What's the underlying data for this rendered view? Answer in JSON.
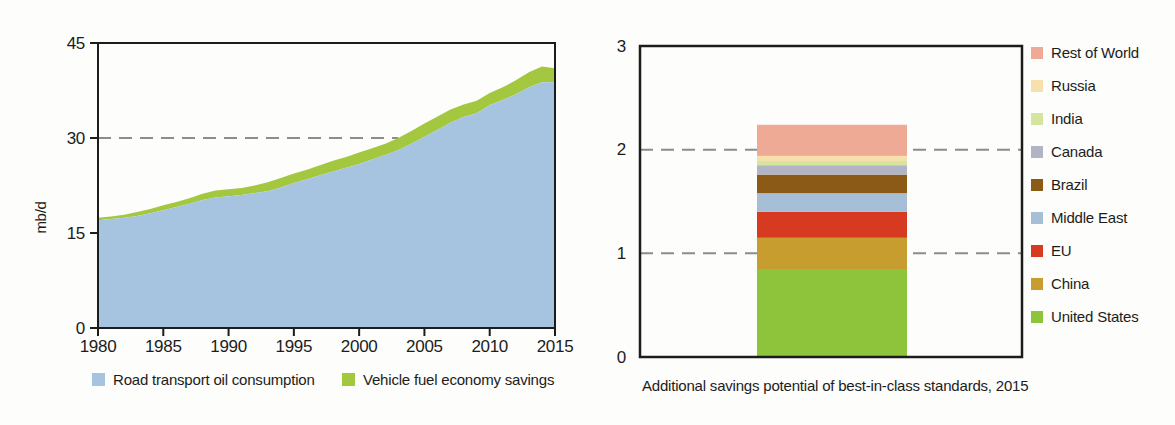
{
  "page": {
    "background_color": "#fdfdfb",
    "text_color": "#1c1c1c",
    "dashed_line_color": "#8c8c8c"
  },
  "chart_data": [
    {
      "type": "area",
      "title": "",
      "ylabel": "mb/d",
      "ylim": [
        0,
        45
      ],
      "yticks": [
        0,
        15,
        30,
        45
      ],
      "xlim": [
        1980,
        2015
      ],
      "xticks": [
        1980,
        1985,
        1990,
        1995,
        2000,
        2005,
        2010,
        2015
      ],
      "grid": "off",
      "legend_position": "bottom",
      "stacked": true,
      "x": [
        1980,
        1981,
        1982,
        1983,
        1984,
        1985,
        1986,
        1987,
        1988,
        1989,
        1990,
        1991,
        1992,
        1993,
        1994,
        1995,
        1996,
        1997,
        1998,
        1999,
        2000,
        2001,
        2002,
        2003,
        2004,
        2005,
        2006,
        2007,
        2008,
        2009,
        2010,
        2011,
        2012,
        2013,
        2014,
        2015
      ],
      "series": [
        {
          "name": "Road transport oil consumption",
          "color": "#a6c3e0",
          "values": [
            17.0,
            17.2,
            17.4,
            17.7,
            18.1,
            18.6,
            19.1,
            19.6,
            20.2,
            20.6,
            20.8,
            21.0,
            21.3,
            21.6,
            22.2,
            22.9,
            23.5,
            24.1,
            24.7,
            25.3,
            25.9,
            26.6,
            27.3,
            28.1,
            29.1,
            30.2,
            31.3,
            32.4,
            33.3,
            33.9,
            35.2,
            36.0,
            36.9,
            38.0,
            38.8,
            38.8
          ]
        },
        {
          "name": "Vehicle fuel economy savings",
          "color": "#a3c73e",
          "values": [
            0.4,
            0.4,
            0.5,
            0.6,
            0.7,
            0.8,
            0.8,
            0.9,
            1.0,
            1.1,
            1.1,
            1.1,
            1.2,
            1.4,
            1.5,
            1.5,
            1.5,
            1.6,
            1.7,
            1.7,
            1.8,
            1.8,
            1.8,
            1.9,
            2.0,
            2.1,
            2.1,
            2.1,
            2.0,
            2.0,
            1.9,
            2.0,
            2.2,
            2.4,
            2.5,
            2.2
          ]
        }
      ],
      "reference_line": {
        "value": 30,
        "style": "dashed",
        "note": "dashes run from y-axis to where the stacked total reaches 30"
      }
    },
    {
      "type": "stacked-bar",
      "caption": "Additional savings potential of best-in-class standards, 2015",
      "ylim": [
        0,
        3
      ],
      "yticks": [
        0,
        1,
        2,
        3
      ],
      "dashed_gridlines": [
        1,
        2
      ],
      "legend_position": "right",
      "total": 2.24,
      "segments": [
        {
          "name": "United States",
          "value": 0.84,
          "color": "#8ec33c"
        },
        {
          "name": "China",
          "value": 0.31,
          "color": "#c89d2f"
        },
        {
          "name": "EU",
          "value": 0.25,
          "color": "#d63a21"
        },
        {
          "name": "Middle East",
          "value": 0.18,
          "color": "#a6bed6"
        },
        {
          "name": "Brazil",
          "value": 0.18,
          "color": "#8a5a16"
        },
        {
          "name": "Canada",
          "value": 0.09,
          "color": "#b1b4c5"
        },
        {
          "name": "India",
          "value": 0.04,
          "color": "#d6e59d"
        },
        {
          "name": "Russia",
          "value": 0.05,
          "color": "#f7e0ab"
        },
        {
          "name": "Rest of World",
          "value": 0.3,
          "color": "#efaa95"
        }
      ]
    }
  ]
}
